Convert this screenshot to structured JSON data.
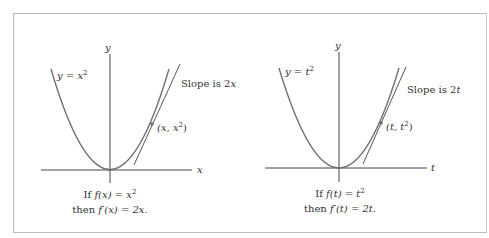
{
  "panels": [
    {
      "function_label": "y = x",
      "function_exp": "2",
      "slope_label": "Slope is 2",
      "slope_var": "x",
      "point_label_a": "(x, x",
      "point_label_exp": "2",
      "point_label_b": ")",
      "x_axis_label": "x",
      "y_axis_label": "y",
      "caption_line1_a": "If ",
      "caption_line1_b": "f(x) = x",
      "caption_line1_exp": "2",
      "caption_line2_a": "then ",
      "caption_line2_b": "f′(x) = 2x."
    },
    {
      "function_label": "y = t",
      "function_exp": "2",
      "slope_label": "Slope is 2",
      "slope_var": "t",
      "point_label_a": "(t, t",
      "point_label_exp": "2",
      "point_label_b": ")",
      "x_axis_label": "t",
      "y_axis_label": "y",
      "caption_line1_a": "If ",
      "caption_line1_b": "f(t) = t",
      "caption_line1_exp": "2",
      "caption_line2_a": "then ",
      "caption_line2_b": "f′(t) = 2t."
    }
  ],
  "colors": {
    "curve": "#7a6a7e",
    "axis": "#444444",
    "tangent": "#555555"
  }
}
